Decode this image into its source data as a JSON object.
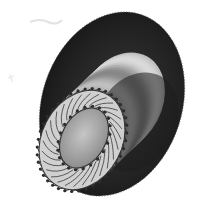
{
  "image": {
    "description": "Grayscale 3D rendering of a cylindrical hub on a large dark disc with arrow vectors around the front face",
    "width": 214,
    "height": 207,
    "colors": {
      "background": "#ffffff",
      "disc_dark": "#1e1e1e",
      "disc_edge": "#2a2a2a",
      "cylinder_light": "#d8d8d8",
      "cylinder_mid": "#9a9a9a",
      "face_inner": "#b4b4b4",
      "arrow": "#2c2c2c"
    },
    "disc": {
      "cx": 112,
      "cy": 104,
      "rx": 70,
      "ry": 94,
      "rotate": 18
    },
    "cylinder": {
      "front_cx": 82,
      "front_cy": 140,
      "back_cx": 122,
      "back_cy": 102,
      "rx": 40,
      "ry": 52,
      "rotate": 28
    },
    "front_face_inner": {
      "cx": 84,
      "cy": 138,
      "rx": 22,
      "ry": 32,
      "rotate": 28
    },
    "arrow_count": 40
  }
}
